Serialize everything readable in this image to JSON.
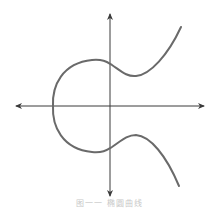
{
  "figure": {
    "type": "elliptic-curve-diagram",
    "colors": {
      "axis": "#3a3a3a",
      "curve": "#6a6a6a",
      "background": "#ffffff",
      "caption": "#c8c8c8"
    },
    "axes": {
      "x_axis": {
        "y": 106,
        "x_start": 16,
        "x_end": 204,
        "arrows": "both"
      },
      "y_axis": {
        "x": 110,
        "y_start": 14,
        "y_end": 196,
        "arrows": "both"
      }
    },
    "curve": {
      "leftmost_point": [
        53,
        106
      ],
      "upper_branch": [
        [
          53,
          106
        ],
        [
          58,
          74
        ],
        [
          93,
          60
        ],
        [
          110,
          64
        ],
        [
          135,
          76
        ],
        [
          181,
          27
        ]
      ],
      "lower_branch": [
        [
          53,
          106
        ],
        [
          58,
          139
        ],
        [
          93,
          152
        ],
        [
          110,
          147
        ],
        [
          135,
          135
        ],
        [
          179,
          186
        ]
      ]
    },
    "caption": "图一一  椭圆曲线"
  }
}
